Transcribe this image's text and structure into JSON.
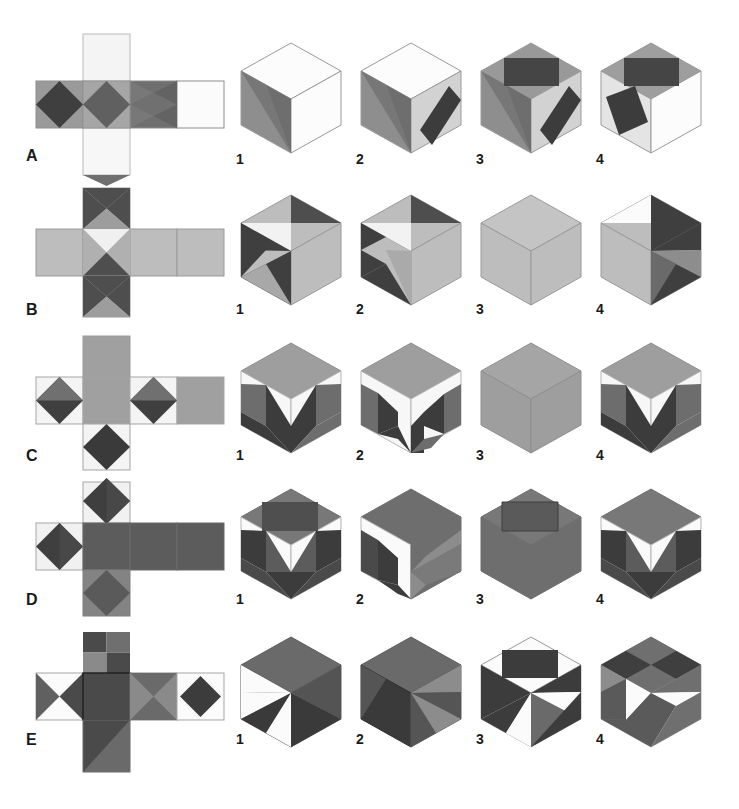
{
  "page": {
    "background_color": "#ffffff",
    "width": 739,
    "height": 809
  },
  "palette": {
    "white": "#ffffff",
    "near_white": "#f4f4f4",
    "light_gray": "#d9d9d9",
    "gray": "#b3b3b3",
    "mid_gray": "#9a9a9a",
    "medium_dark_gray": "#7a7a7a",
    "dark_gray": "#5c5c5c",
    "darker_gray": "#4a4a4a",
    "charcoal": "#3a3a3a",
    "near_black": "#2b2b2b",
    "outline": "#8e8e8e",
    "text": "#1a1a1a"
  },
  "option_labels": [
    "1",
    "2",
    "3",
    "4"
  ],
  "rows": [
    {
      "label": "A",
      "net_name": "net-a",
      "options": [
        {
          "label": "1",
          "name": "cube-a-1"
        },
        {
          "label": "2",
          "name": "cube-a-2"
        },
        {
          "label": "3",
          "name": "cube-a-3"
        },
        {
          "label": "4",
          "name": "cube-a-4"
        }
      ]
    },
    {
      "label": "B",
      "net_name": "net-b",
      "options": [
        {
          "label": "1",
          "name": "cube-b-1"
        },
        {
          "label": "2",
          "name": "cube-b-2"
        },
        {
          "label": "3",
          "name": "cube-b-3"
        },
        {
          "label": "4",
          "name": "cube-b-4"
        }
      ]
    },
    {
      "label": "C",
      "net_name": "net-c",
      "options": [
        {
          "label": "1",
          "name": "cube-c-1"
        },
        {
          "label": "2",
          "name": "cube-c-2"
        },
        {
          "label": "3",
          "name": "cube-c-3"
        },
        {
          "label": "4",
          "name": "cube-c-4"
        }
      ]
    },
    {
      "label": "D",
      "net_name": "net-d",
      "options": [
        {
          "label": "1",
          "name": "cube-d-1"
        },
        {
          "label": "2",
          "name": "cube-d-2"
        },
        {
          "label": "3",
          "name": "cube-d-3"
        },
        {
          "label": "4",
          "name": "cube-d-4"
        }
      ]
    },
    {
      "label": "E",
      "net_name": "net-e",
      "options": [
        {
          "label": "1",
          "name": "cube-e-1"
        },
        {
          "label": "2",
          "name": "cube-e-2"
        },
        {
          "label": "3",
          "name": "cube-e-3"
        },
        {
          "label": "4",
          "name": "cube-e-4"
        }
      ]
    }
  ]
}
